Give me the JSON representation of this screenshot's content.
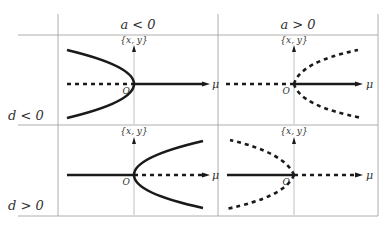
{
  "columns": [
    {
      "label": "a < 0"
    },
    {
      "label": "a > 0"
    }
  ],
  "rows": [
    {
      "label": "d < 0"
    },
    {
      "label": "d > 0"
    }
  ],
  "axis_labels": {
    "vertical": "{x, y}",
    "horizontal": "μ",
    "origin": "O"
  },
  "panels": [
    {
      "id": "a-neg-d-neg",
      "description": "Branches open to the left (stable, solid); trivial branch unstable (dashed) for μ<0, stable (solid) for μ>0"
    },
    {
      "id": "a-pos-d-neg",
      "description": "Branches open to the right (unstable, dashed); trivial branch dashed for μ<0, solid for μ>0"
    },
    {
      "id": "a-neg-d-pos",
      "description": "Branches open to the right (stable, solid); trivial branch solid for μ<0, dashed for μ>0"
    },
    {
      "id": "a-pos-d-pos",
      "description": "Branches open to the left (unstable, dashed); trivial branch solid for μ<0, dashed for μ>0"
    }
  ]
}
